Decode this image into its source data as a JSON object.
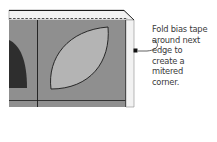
{
  "caption": {
    "lines": [
      "Fold bias tape",
      "around next",
      "edge to",
      "create a",
      "mitered",
      "corner."
    ]
  },
  "colors": {
    "quilt_gray": "#8f8f8f",
    "leaf_gray": "#b4b4b4",
    "dark_shape": "#2e2e2e",
    "bias_tape": "#f2f2f2",
    "outline": "#1a1a1a",
    "caption_text": "#3a3a3a"
  }
}
